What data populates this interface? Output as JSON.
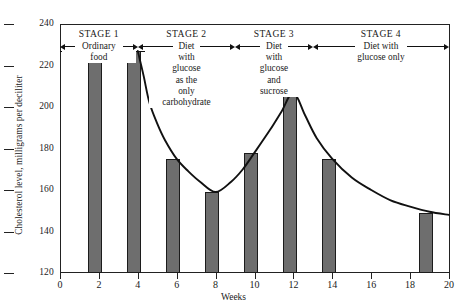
{
  "chart_data": {
    "type": "bar",
    "title": "",
    "xlabel": "Weeks",
    "ylabel": "Cholesterol level, milligrams per deciliter",
    "xlim": [
      0,
      20
    ],
    "ylim": [
      120,
      240
    ],
    "ytick_labels": [
      "120",
      "140",
      "160",
      "180",
      "200",
      "220",
      "240"
    ],
    "ytick_values": [
      120,
      140,
      160,
      180,
      200,
      220,
      240
    ],
    "xtick_labels": [
      "0",
      "2",
      "4",
      "6",
      "8",
      "10",
      "12",
      "14",
      "16",
      "18",
      "20"
    ],
    "xtick_values": [
      0,
      2,
      4,
      6,
      8,
      10,
      12,
      14,
      16,
      18,
      20
    ],
    "grid": false,
    "legend": "none",
    "categories": [
      2,
      4,
      6,
      8,
      10,
      12,
      14,
      19
    ],
    "values": [
      227,
      227,
      175,
      159,
      178,
      207,
      175,
      149
    ],
    "bar_color": "#6e6e6e",
    "baseline_value": 227,
    "curve_points": [
      [
        4.0,
        227
      ],
      [
        4.3,
        215
      ],
      [
        4.6,
        202
      ],
      [
        5.0,
        192
      ],
      [
        5.4,
        184
      ],
      [
        6.0,
        175
      ],
      [
        6.6,
        169
      ],
      [
        7.2,
        164
      ],
      [
        8.0,
        159
      ],
      [
        8.8,
        164
      ],
      [
        9.4,
        170
      ],
      [
        10.0,
        178
      ],
      [
        10.8,
        189
      ],
      [
        11.4,
        198
      ],
      [
        12.0,
        207
      ],
      [
        12.6,
        196
      ],
      [
        13.2,
        185
      ],
      [
        14.0,
        175
      ],
      [
        15.0,
        166
      ],
      [
        16.0,
        160
      ],
      [
        17.0,
        155
      ],
      [
        18.0,
        152
      ],
      [
        19.0,
        149.5
      ],
      [
        20.0,
        148
      ]
    ]
  },
  "annotations": {
    "stages": [
      {
        "title": "STAGE 1",
        "body": "Ordinary\nfood",
        "body_lines": [
          "Ordinary",
          "food"
        ],
        "inline_label": "Ordinary",
        "start_week": 0,
        "end_week": 4
      },
      {
        "title": "STAGE 2",
        "body_lines": [
          "Diet",
          "with",
          "glucose",
          "as the",
          "only",
          "carbohydrate"
        ],
        "inline_label": "Diet",
        "start_week": 4,
        "end_week": 9
      },
      {
        "title": "STAGE 3",
        "body_lines": [
          "Diet",
          "with",
          "glucose",
          "and",
          "sucrose"
        ],
        "inline_label": "Diet",
        "start_week": 9,
        "end_week": 13
      },
      {
        "title": "STAGE 4",
        "body_lines": [
          "Diet with",
          "glucose only"
        ],
        "inline_label": "Diet with",
        "start_week": 13,
        "end_week": 20
      }
    ]
  },
  "colors": {
    "bar_fill": "#6e6e6e",
    "bar_stroke": "#1c1c1c",
    "axis": "#222222",
    "curve": "#111111",
    "background": "#ffffff"
  }
}
